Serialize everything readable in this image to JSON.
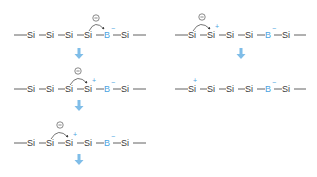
{
  "colors": {
    "boron": "#4aa3df",
    "arrow": "#7fbde8",
    "text": "#3a3a3a"
  },
  "diagram": {
    "left_column": [
      {
        "atoms": [
          "Si",
          "Si",
          "Si",
          "Si",
          "B",
          "Si"
        ],
        "electron_pair_over": "Si-B bond (4th Si to B)",
        "charges": {
          "B": "−"
        },
        "lone_pair_label": "⊖"
      },
      {
        "atoms": [
          "Si",
          "Si",
          "Si",
          "Si",
          "B",
          "Si"
        ],
        "electron_pair_over": "3rd Si to 4th Si",
        "charges": {
          "Si4": "+",
          "B": "−"
        },
        "lone_pair_label": "⊖"
      },
      {
        "atoms": [
          "Si",
          "Si",
          "Si",
          "Si",
          "B",
          "Si"
        ],
        "electron_pair_over": "2nd Si to 3rd Si",
        "charges": {
          "Si3": "+",
          "B": "−"
        },
        "lone_pair_label": "⊖"
      }
    ],
    "right_column": [
      {
        "atoms": [
          "Si",
          "Si",
          "Si",
          "Si",
          "B",
          "Si"
        ],
        "electron_pair_over": "1st Si to 2nd Si",
        "charges": {
          "Si2": "+",
          "B": "−"
        },
        "lone_pair_label": "⊖"
      },
      {
        "atoms": [
          "Si",
          "Si",
          "Si",
          "Si",
          "B",
          "Si"
        ],
        "charges": {
          "Si1": "+",
          "B": "−"
        }
      }
    ],
    "labels": {
      "si": "Si",
      "b": "B",
      "plus": "+",
      "minus": "−",
      "lone_pair": "−"
    }
  }
}
